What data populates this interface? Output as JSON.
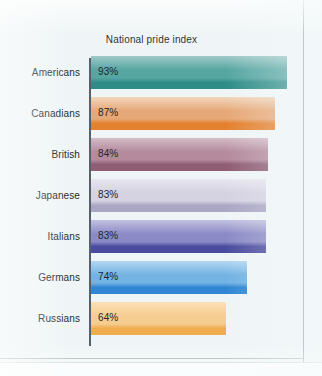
{
  "figure": {
    "title": "National pride index",
    "background_color": "#eff5f6",
    "frame_color": "#9aa6a9",
    "axis_color": "#55606a"
  },
  "chart_data": {
    "type": "bar",
    "orientation": "horizontal",
    "title": "National pride index",
    "xlabel": "",
    "ylabel": "",
    "xlim": [
      0,
      100
    ],
    "grid": false,
    "legend": null,
    "value_suffix": "%",
    "categories": [
      "Americans",
      "Canadians",
      "British",
      "Japanese",
      "Italians",
      "Germans",
      "Russians"
    ],
    "values": [
      93,
      87,
      84,
      83,
      83,
      74,
      64
    ],
    "data_labels": [
      "93%",
      "87%",
      "84%",
      "83%",
      "83%",
      "74%",
      "64%"
    ],
    "bars": [
      {
        "category": "Americans",
        "value": 93,
        "label": "93%",
        "color_top": "#9fc9c7",
        "color_mid": "#56a6a2",
        "color_bottom": "#2f8d88"
      },
      {
        "category": "Canadians",
        "value": 87,
        "label": "87%",
        "color_top": "#f1d6bd",
        "color_mid": "#e7a877",
        "color_bottom": "#e4812f"
      },
      {
        "category": "British",
        "value": 84,
        "label": "84%",
        "color_top": "#d4bcc6",
        "color_mid": "#b48a9c",
        "color_bottom": "#8e5d74"
      },
      {
        "category": "Japanese",
        "value": 83,
        "label": "83%",
        "color_top": "#e8e6ef",
        "color_mid": "#d5d2e2",
        "color_bottom": "#aaa6c4"
      },
      {
        "category": "Italians",
        "value": 83,
        "label": "83%",
        "color_top": "#c3c1e0",
        "color_mid": "#8b8ac6",
        "color_bottom": "#4a4b9e"
      },
      {
        "category": "Germans",
        "value": 74,
        "label": "74%",
        "color_top": "#b4d7f1",
        "color_mid": "#73b3e4",
        "color_bottom": "#2f86d2"
      },
      {
        "category": "Russians",
        "value": 64,
        "label": "64%",
        "color_top": "#fbe0b6",
        "color_mid": "#f6cd90",
        "color_bottom": "#f0ab4e"
      }
    ]
  }
}
